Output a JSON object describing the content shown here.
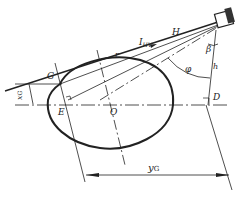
{
  "diagram": {
    "title": "",
    "labels": {
      "G": "G",
      "E": "E",
      "O": "O",
      "D": "D",
      "r": "r",
      "H": "H",
      "I": "I",
      "I_sub": "HV",
      "beta": "β",
      "phi": "φ",
      "h": "h",
      "y": "y",
      "y_sub": "G",
      "x": "x",
      "x_sub": "G"
    },
    "colors": {
      "stroke": "#222222",
      "background": "#ffffff"
    }
  }
}
